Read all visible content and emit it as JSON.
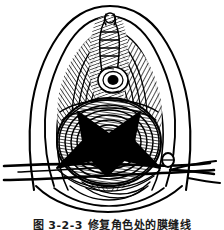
{
  "figure": {
    "kind": "medical-line-illustration",
    "technique": "pen-and-ink cross-hatching",
    "background_color": "#ffffff",
    "ink_color": "#000000",
    "elements": {
      "outer_contour": "labia majora outline, two nested curved contours on each side",
      "inner_folds": "concentric hatched folds converging toward midline",
      "upper_midline": "clitoral hood and midline raphe with fine hatching",
      "small_opening": "urethral meatus, small dark aperture ringed by concentric lines",
      "lower_oval": "introitus rendered as densely hatched oval",
      "x_mark": "solid black X-shaped incision marker over the lower oval",
      "instrument": "surgical retractor / speculum blade crossing horizontally with a small round knob on the right",
      "instrument_knob": "small circular joint or thumb screw on the right shank"
    },
    "geometry": {
      "x_mark_center": [
        107,
        142
      ],
      "x_mark_size": 62,
      "opening_center": [
        114,
        80
      ],
      "instrument_y": 172
    }
  },
  "caption": {
    "number": "图 3-2-3",
    "text": "修复角色处的膜缝线",
    "full": "图 3-2-3  修复角色处的膜缝线",
    "clipped": true,
    "note": "caption is cut off by the bottom edge of the image; only the upper strokes are visible"
  },
  "colors": {
    "ink": "#000000",
    "paper": "#ffffff",
    "hatch_mid": "#4a4a4a"
  }
}
